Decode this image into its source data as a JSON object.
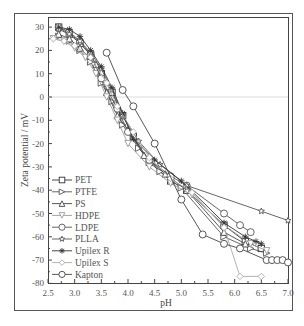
{
  "caption_fragment_top": "",
  "caption_fragment_bottom": "",
  "chart_data": {
    "type": "line",
    "title": "",
    "xlabel": "pH",
    "ylabel": "Zeta potential / mV",
    "xlim": [
      2.5,
      7.0
    ],
    "ylim": [
      -80,
      30
    ],
    "xticks": [
      2.5,
      3.0,
      3.5,
      4.0,
      4.5,
      5.0,
      5.5,
      6.0,
      6.5,
      7.0
    ],
    "yticks": [
      30,
      20,
      10,
      0,
      -10,
      -20,
      -30,
      -40,
      -50,
      -60,
      -70,
      -80
    ],
    "xtick_labels": [
      "2.5",
      "3.0",
      "3.5",
      "4.0",
      "4.5",
      "5.0",
      "5.5",
      "6.0",
      "6.5",
      "7.0"
    ],
    "ytick_labels": [
      "30",
      "20",
      "10",
      "0",
      "-10",
      "-20",
      "-30",
      "-40",
      "-50",
      "-60",
      "-70",
      "-80"
    ],
    "grid": false,
    "zero_line": true,
    "legend_position": "lower left",
    "series": [
      {
        "name": "PET",
        "marker": "square",
        "x": [
          2.7,
          2.9,
          3.1,
          3.3,
          3.5,
          3.7,
          3.9,
          4.1,
          4.4,
          4.8,
          5.1,
          5.8,
          6.2,
          6.5
        ],
        "y": [
          30,
          27,
          23,
          18,
          10,
          2,
          -8,
          -17,
          -28,
          -36,
          -40,
          -55,
          -62,
          -65
        ]
      },
      {
        "name": "PTFE",
        "marker": "triangle-right",
        "x": [
          2.7,
          2.9,
          3.1,
          3.3,
          3.5,
          3.7,
          3.9,
          4.2,
          4.6,
          5.0,
          5.8,
          6.3,
          6.6
        ],
        "y": [
          26,
          24,
          20,
          15,
          6,
          -2,
          -12,
          -22,
          -32,
          -39,
          -60,
          -65,
          -67
        ]
      },
      {
        "name": "PS",
        "marker": "triangle-up",
        "x": [
          2.7,
          2.9,
          3.1,
          3.4,
          3.6,
          3.8,
          4.0,
          4.3,
          4.7,
          5.1,
          5.8,
          6.2
        ],
        "y": [
          27,
          25,
          21,
          14,
          2,
          -8,
          -14,
          -25,
          -33,
          -40,
          -58,
          -63
        ]
      },
      {
        "name": "HDPE",
        "marker": "triangle-down",
        "x": [
          2.6,
          2.8,
          3.0,
          3.2,
          3.4,
          3.6,
          3.8,
          4.0,
          4.4,
          4.8,
          5.2,
          5.8,
          6.3,
          6.6
        ],
        "y": [
          25,
          24,
          21,
          17,
          10,
          0,
          -10,
          -20,
          -30,
          -37,
          -42,
          -55,
          -63,
          -66
        ]
      },
      {
        "name": "LDPE",
        "marker": "circle",
        "x": [
          2.7,
          2.9,
          3.1,
          3.3,
          3.5,
          3.8,
          4.0,
          4.4,
          4.8,
          5.1,
          5.8,
          6.1,
          6.3
        ],
        "y": [
          30,
          28,
          24,
          18,
          8,
          -5,
          -15,
          -27,
          -34,
          -38,
          -50,
          -55,
          -58
        ]
      },
      {
        "name": "PLLA",
        "marker": "star",
        "x": [
          2.7,
          2.9,
          3.1,
          3.3,
          3.5,
          3.7,
          3.9,
          4.2,
          4.6,
          5.1,
          6.5,
          7.0
        ],
        "y": [
          29,
          27,
          24,
          19,
          12,
          3,
          -8,
          -19,
          -29,
          -38,
          -49,
          -53
        ]
      },
      {
        "name": "Upilex R",
        "marker": "asterisk",
        "x": [
          2.7,
          2.9,
          3.1,
          3.3,
          3.5,
          3.7,
          3.9,
          4.1,
          4.5,
          5.0,
          5.8,
          6.2,
          6.4,
          6.5
        ],
        "y": [
          30,
          29,
          26,
          20,
          13,
          4,
          -7,
          -18,
          -27,
          -36,
          -54,
          -60,
          -62,
          -63
        ]
      },
      {
        "name": "Upilex S",
        "marker": "diamond",
        "x": [
          2.6,
          2.8,
          3.0,
          3.3,
          3.6,
          3.8,
          4.1,
          4.4,
          4.8,
          5.2,
          5.8,
          6.1,
          6.5
        ],
        "y": [
          25,
          24,
          22,
          17,
          6,
          -4,
          -15,
          -26,
          -35,
          -41,
          -56,
          -77,
          -77
        ]
      },
      {
        "name": "Kapton",
        "marker": "circle",
        "x": [
          3.6,
          3.9,
          4.1,
          4.5,
          5.0,
          5.4,
          5.8,
          6.1,
          6.6,
          6.7,
          6.8,
          6.9,
          7.0
        ],
        "y": [
          19,
          3,
          -4,
          -20,
          -44,
          -59,
          -63,
          -65,
          -70,
          -70,
          -70,
          -70,
          -71
        ]
      }
    ]
  }
}
